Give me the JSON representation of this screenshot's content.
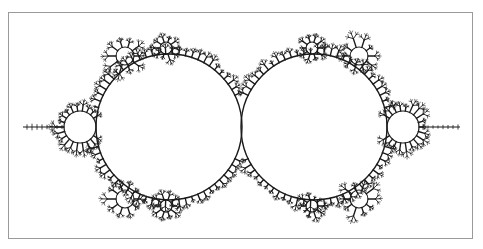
{
  "figure": {
    "stroke_color": "#1a1a1a",
    "frame_color": "#9a9a9a",
    "main_circles": [
      {
        "cx": 169,
        "cy": 127,
        "r": 73
      },
      {
        "cx": 314,
        "cy": 127,
        "r": 73
      }
    ],
    "side_bulbs": [
      {
        "cx": 80,
        "cy": 127,
        "r": 16
      },
      {
        "cx": 403,
        "cy": 127,
        "r": 16
      }
    ],
    "minor_bulbs": [
      {
        "cx": 125,
        "cy": 56,
        "r": 9
      },
      {
        "cx": 359,
        "cy": 56,
        "r": 9
      },
      {
        "cx": 125,
        "cy": 199,
        "r": 9
      },
      {
        "cx": 359,
        "cy": 199,
        "r": 9
      },
      {
        "cx": 166,
        "cy": 48,
        "r": 6
      },
      {
        "cx": 312,
        "cy": 48,
        "r": 6
      },
      {
        "cx": 166,
        "cy": 206,
        "r": 6
      },
      {
        "cx": 312,
        "cy": 206,
        "r": 6
      }
    ],
    "antennae": [
      {
        "x1": 23,
        "x2": 64,
        "y": 127
      },
      {
        "x1": 419,
        "x2": 460,
        "y": 127
      }
    ]
  }
}
